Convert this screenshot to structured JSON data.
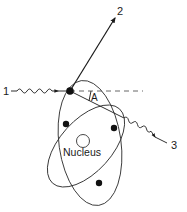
{
  "diagram": {
    "type": "compton-scattering-atom",
    "labels": {
      "incident": "1",
      "scattered_electron": "2",
      "scattered_photon": "3",
      "angle": "A",
      "nucleus": "Nucleus"
    },
    "colors": {
      "stroke": "#1a1a1a",
      "background": "#ffffff"
    }
  }
}
